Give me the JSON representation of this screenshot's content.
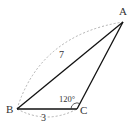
{
  "diagram": {
    "vertices": {
      "A": {
        "label": "A",
        "x": 123,
        "y": 22
      },
      "B": {
        "label": "B",
        "x": 17,
        "y": 109
      },
      "C": {
        "label": "C",
        "x": 77,
        "y": 109
      }
    },
    "sides": {
      "AB": {
        "label": "7"
      },
      "BC": {
        "label": "3"
      }
    },
    "angles": {
      "C": {
        "label": "120°"
      }
    },
    "colors": {
      "line": "#111111",
      "dash": "#9a9a9a",
      "text": "#333333"
    }
  }
}
